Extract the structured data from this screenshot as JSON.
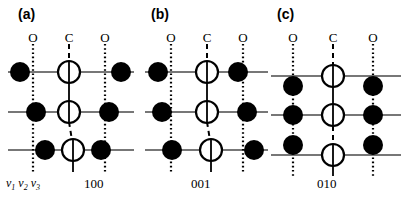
{
  "figure": {
    "type": "crystal-vibrational-mode-diagram",
    "background": "#ffffff",
    "width": 403,
    "height": 207,
    "atom_colors": {
      "oxygen": "#000000",
      "carbon_fill": "#ffffff",
      "carbon_stroke": "#000000",
      "row_line": "#4a4a4a",
      "reference_line": "#000000"
    },
    "v_labels": "v1 v2 v3",
    "v_label_parts": [
      {
        "sym": "v",
        "sub": "1"
      },
      {
        "sym": "v",
        "sub": "2"
      },
      {
        "sym": "v",
        "sub": "3"
      }
    ]
  },
  "panels": [
    {
      "id": "a",
      "label": "(a)",
      "caption": "100",
      "column_labels": [
        "O",
        "C",
        "O"
      ],
      "mode": "symmetric-stretch",
      "rows": [
        {
          "index": 0,
          "y": 72,
          "atoms": [
            {
              "species": "O",
              "ref_x": 33,
              "x": 20,
              "dy": 0,
              "dx": -13
            },
            {
              "species": "C",
              "ref_x": 69,
              "x": 69,
              "dy": 0,
              "dx": 0
            },
            {
              "species": "O",
              "ref_x": 105,
              "x": 121,
              "dy": 0,
              "dx": 16
            }
          ]
        },
        {
          "index": 1,
          "y": 112,
          "atoms": [
            {
              "species": "O",
              "ref_x": 33,
              "x": 36,
              "dy": 0,
              "dx": 3
            },
            {
              "species": "C",
              "ref_x": 69,
              "x": 69,
              "dy": 0,
              "dx": 0
            },
            {
              "species": "O",
              "ref_x": 105,
              "x": 109,
              "dy": 0,
              "dx": 4
            }
          ]
        },
        {
          "index": 2,
          "y": 150,
          "atoms": [
            {
              "species": "O",
              "ref_x": 33,
              "x": 45,
              "dy": 0,
              "dx": 12
            },
            {
              "species": "C",
              "ref_x": 69,
              "x": 73,
              "dy": 0,
              "dx": 4
            },
            {
              "species": "O",
              "ref_x": 105,
              "x": 101,
              "dy": 0,
              "dx": -4
            }
          ]
        }
      ],
      "reference_lines": [
        {
          "x": 33,
          "y1": 44,
          "y2": 170
        },
        {
          "x": 105,
          "y1": 44,
          "y2": 170
        }
      ],
      "carbon_axis": {
        "x": 69,
        "y1": 44,
        "y2": 170
      }
    },
    {
      "id": "b",
      "label": "(b)",
      "caption": "001",
      "column_labels": [
        "O",
        "C",
        "O"
      ],
      "mode": "asymmetric-stretch",
      "rows": [
        {
          "index": 0,
          "y": 72,
          "atoms": [
            {
              "species": "O",
              "ref_x": 38,
              "x": 25,
              "dy": 0,
              "dx": -13
            },
            {
              "species": "C",
              "ref_x": 74,
              "x": 74,
              "dy": 0,
              "dx": 0
            },
            {
              "species": "O",
              "ref_x": 110,
              "x": 105,
              "dy": 0,
              "dx": -5
            }
          ]
        },
        {
          "index": 1,
          "y": 112,
          "atoms": [
            {
              "species": "O",
              "ref_x": 38,
              "x": 29,
              "dy": 0,
              "dx": -9
            },
            {
              "species": "C",
              "ref_x": 74,
              "x": 74,
              "dy": 0,
              "dx": 0
            },
            {
              "species": "O",
              "ref_x": 110,
              "x": 114,
              "dy": 0,
              "dx": 4
            }
          ]
        },
        {
          "index": 2,
          "y": 150,
          "atoms": [
            {
              "species": "O",
              "ref_x": 38,
              "x": 39,
              "dy": 0,
              "dx": 1
            },
            {
              "species": "C",
              "ref_x": 74,
              "x": 78,
              "dy": 0,
              "dx": 4
            },
            {
              "species": "O",
              "ref_x": 110,
              "x": 121,
              "dy": 0,
              "dx": 11
            }
          ]
        }
      ],
      "reference_lines": [
        {
          "x": 38,
          "y1": 44,
          "y2": 170
        },
        {
          "x": 110,
          "y1": 44,
          "y2": 170
        }
      ],
      "carbon_axis": {
        "x": 74,
        "y1": 44,
        "y2": 170
      }
    },
    {
      "id": "c",
      "label": "(c)",
      "caption": "010",
      "column_labels": [
        "O",
        "C",
        "O"
      ],
      "mode": "bending",
      "rows": [
        {
          "index": 0,
          "y": 76,
          "atoms": [
            {
              "species": "O",
              "ref_x": 30,
              "x": 30,
              "dy": 10,
              "dx": 0
            },
            {
              "species": "C",
              "ref_x": 70,
              "x": 70,
              "dy": 0,
              "dx": 0
            },
            {
              "species": "O",
              "ref_x": 110,
              "x": 110,
              "dy": 10,
              "dx": 0
            }
          ]
        },
        {
          "index": 1,
          "y": 115,
          "atoms": [
            {
              "species": "O",
              "ref_x": 30,
              "x": 30,
              "dy": 0,
              "dx": 0
            },
            {
              "species": "C",
              "ref_x": 70,
              "x": 70,
              "dy": 0,
              "dx": 0
            },
            {
              "species": "O",
              "ref_x": 110,
              "x": 110,
              "dy": 0,
              "dx": 0
            }
          ]
        },
        {
          "index": 2,
          "y": 155,
          "atoms": [
            {
              "species": "O",
              "ref_x": 30,
              "x": 30,
              "dy": -10,
              "dx": 0
            },
            {
              "species": "C",
              "ref_x": 70,
              "x": 70,
              "dy": 0,
              "dx": 0
            },
            {
              "species": "O",
              "ref_x": 110,
              "x": 110,
              "dy": -10,
              "dx": 0
            }
          ]
        }
      ],
      "reference_lines": [
        {
          "x": 30,
          "y1": 44,
          "y2": 176
        },
        {
          "x": 110,
          "y1": 44,
          "y2": 176
        }
      ],
      "carbon_axis": {
        "x": 70,
        "y1": 44,
        "y2": 176
      }
    }
  ]
}
